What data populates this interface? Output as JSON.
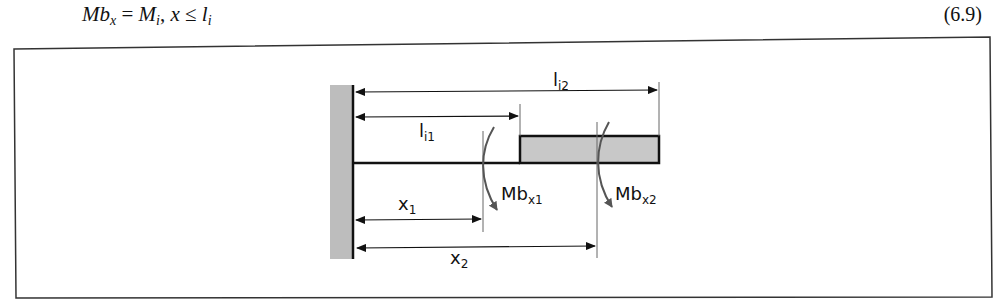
{
  "equation": {
    "lhs_main": "Mb",
    "lhs_sub": "x",
    "eq": " = ",
    "rhs1_main": "M",
    "rhs1_sub": "i",
    "sep": ", ",
    "var": "x",
    "leq": " ≤ ",
    "rhs2_main": "l",
    "rhs2_sub": "i",
    "number": "(6.9)"
  },
  "figure": {
    "colors": {
      "wall_fill": "#bdbdbd",
      "beam_fill": "#c8c8c8",
      "line": "#111111",
      "moment_arrow": "#555555",
      "section_line": "#666666"
    },
    "labels": {
      "li2_main": "l",
      "li2_sub": "i2",
      "li1_main": "l",
      "li1_sub": "i1",
      "x1_main": "x",
      "x1_sub": "1",
      "x2_main": "x",
      "x2_sub": "2",
      "mbx1_main": "Mb",
      "mbx1_sub": "x1",
      "mbx2_main": "Mb",
      "mbx2_sub": "x2"
    }
  }
}
